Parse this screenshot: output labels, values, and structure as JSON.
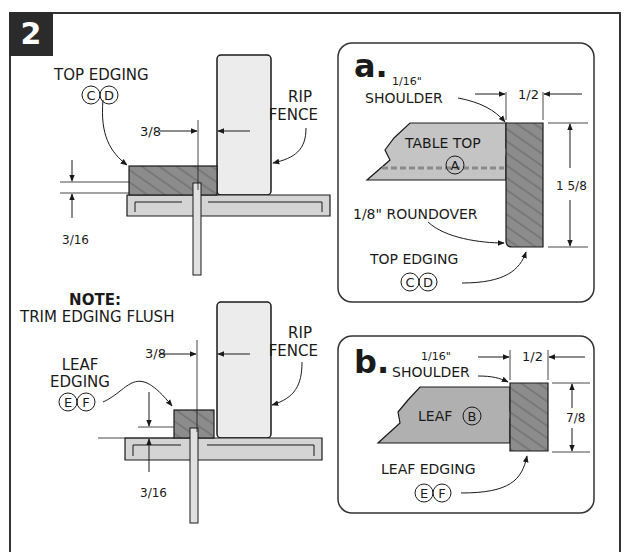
{
  "figure": {
    "number": "2",
    "colors": {
      "badge": "#2b2b2b",
      "wood": "#8a8a8a",
      "panel": "#b9b9b9",
      "fence": "#ececec",
      "table": "#cfcfcf",
      "line": "#1a1a1a"
    }
  },
  "top_view": {
    "edging_label": "TOP EDGING",
    "edging_parts": [
      "C",
      "D"
    ],
    "fence_label_1": "RIP",
    "fence_label_2": "FENCE",
    "fence_offset": "3/8",
    "height_offset": "3/16"
  },
  "bottom_view": {
    "note_title": "NOTE:",
    "note_text": "TRIM EDGING FLUSH",
    "edging_label_1": "LEAF",
    "edging_label_2": "EDGING",
    "edging_parts": [
      "E",
      "F"
    ],
    "fence_label_1": "RIP",
    "fence_label_2": "FENCE",
    "fence_offset": "3/8",
    "height_offset": "3/16"
  },
  "detail_a": {
    "letter": "a.",
    "shoulder_dim": "1/16\"",
    "shoulder_label": "SHOULDER",
    "width_dim": "1/2",
    "panel_label": "TABLE TOP",
    "panel_part": "A",
    "height_dim": "1 5/8",
    "roundover_label": "1/8\" ROUNDOVER",
    "edging_label": "TOP EDGING",
    "edging_parts": [
      "C",
      "D"
    ]
  },
  "detail_b": {
    "letter": "b.",
    "shoulder_dim": "1/16\"",
    "shoulder_label": "SHOULDER",
    "width_dim": "1/2",
    "panel_label": "LEAF",
    "panel_part": "B",
    "height_dim": "7/8",
    "edging_label": "LEAF EDGING",
    "edging_parts": [
      "E",
      "F"
    ]
  }
}
